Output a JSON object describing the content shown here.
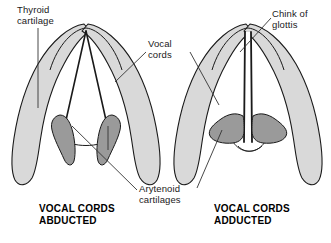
{
  "figure": {
    "background_color": "#ffffff",
    "colors": {
      "thyroid_cartilage_fill": "#d9d9d9",
      "arytenoid_cartilage_fill": "#9a9a9a",
      "outline": "#1a1a1a",
      "leader_line": "#333333",
      "text": "#1a1a1a"
    }
  },
  "labels": {
    "thyroid_cartilage": "Thyroid\ncartilage",
    "vocal_cords": "Vocal\ncords",
    "chink_of_glottis": "Chink of\nglottis",
    "arytenoid_cartilages": "Arytenoid\ncartilages"
  },
  "panels": [
    {
      "id": "abducted",
      "caption": "VOCAL CORDS\nABDUCTED",
      "state": "abducted",
      "description": "Vocal cords separated forming a wide triangular glottic opening",
      "glottis_shape": "wide triangle"
    },
    {
      "id": "adducted",
      "caption": "VOCAL CORDS\nADDUCTED",
      "state": "adducted",
      "description": "Vocal cords approximated at the midline leaving a narrow chink of glottis",
      "glottis_shape": "narrow slit"
    }
  ],
  "structures": [
    {
      "name": "thyroid cartilage",
      "count": 2,
      "shade": "light gray"
    },
    {
      "name": "vocal cords",
      "count": 2,
      "shade": "outline"
    },
    {
      "name": "arytenoid cartilages",
      "count": 2,
      "shade": "dark gray"
    },
    {
      "name": "chink of glottis",
      "count": 1,
      "shade": "white"
    }
  ]
}
